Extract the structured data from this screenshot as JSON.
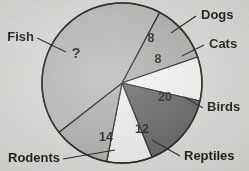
{
  "figure": {
    "background_color": "#d9d9d6",
    "outline_color": "#151515",
    "text_color": "#111111"
  },
  "chart_data": {
    "type": "pie",
    "title": "",
    "subtitle": "",
    "xlabel": "",
    "ylabel": "",
    "legend_position": "callout-labels",
    "grid": false,
    "center": {
      "x": 122,
      "y": 83
    },
    "radius": 80,
    "total_known": 62,
    "unknown_slice": "Fish",
    "unknown_value_text": "?",
    "categories": [
      "Dogs",
      "Cats",
      "Birds",
      "Reptiles",
      "Rodents",
      "Fish"
    ],
    "values": [
      8,
      8,
      20,
      12,
      14,
      null
    ],
    "value_labels": [
      "8",
      "8",
      "20",
      "12",
      "14",
      "?"
    ],
    "slices": [
      {
        "name": "Dogs",
        "label": "Dogs",
        "value": 8,
        "value_label": "8",
        "color": "#a8a8a5",
        "start_angle": -62,
        "end_angle": -19,
        "value_x": 151,
        "value_y": 42,
        "leader": {
          "x1": 171,
          "y1": 33,
          "x2": 196,
          "y2": 16
        },
        "label_x": 201,
        "label_y": 19,
        "label_anchor": "start"
      },
      {
        "name": "Cats",
        "label": "Cats",
        "value": 8,
        "value_label": "8",
        "color": "#f2f2ef",
        "start_angle": -19,
        "end_angle": 13,
        "value_x": 158,
        "value_y": 63,
        "leader": {
          "x1": 182,
          "y1": 56,
          "x2": 204,
          "y2": 45
        },
        "label_x": 209,
        "label_y": 48,
        "label_anchor": "start"
      },
      {
        "name": "Birds",
        "label": "Birds",
        "value": 20,
        "value_label": "20",
        "color": "#595959",
        "start_angle": 13,
        "end_angle": 68,
        "value_x": 165,
        "value_y": 101,
        "leader": {
          "x1": 184,
          "y1": 97,
          "x2": 203,
          "y2": 108
        },
        "label_x": 207,
        "label_y": 111,
        "label_anchor": "start"
      },
      {
        "name": "Reptiles",
        "label": "Reptiles",
        "value": 12,
        "value_label": "12",
        "color": "#ececea",
        "start_angle": 68,
        "end_angle": 101,
        "value_x": 142,
        "value_y": 133,
        "leader": {
          "x1": 152,
          "y1": 140,
          "x2": 180,
          "y2": 156
        },
        "label_x": 184,
        "label_y": 160,
        "label_anchor": "start"
      },
      {
        "name": "Rodents",
        "label": "Rodents",
        "value": 14,
        "value_label": "14",
        "color": "#aaaaa7",
        "start_angle": 101,
        "end_angle": 142,
        "value_x": 106,
        "value_y": 141,
        "leader": {
          "x1": 115,
          "y1": 150,
          "x2": 63,
          "y2": 159
        },
        "label_x": 60,
        "label_y": 162,
        "label_anchor": "end"
      },
      {
        "name": "Fish",
        "label": "Fish",
        "value": null,
        "value_label": "?",
        "color": "#b4b4b1",
        "start_angle": 142,
        "end_angle": 298,
        "value_x": 76,
        "value_y": 58,
        "leader": {
          "x1": 66,
          "y1": 52,
          "x2": 37,
          "y2": 38
        },
        "label_x": 34,
        "label_y": 41,
        "label_anchor": "end"
      }
    ]
  }
}
